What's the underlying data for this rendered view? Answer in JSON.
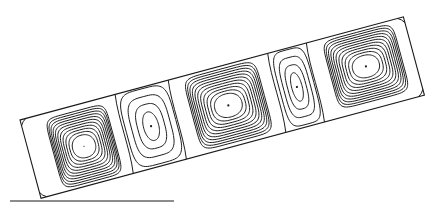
{
  "figure": {
    "stroke_color": "#1a1a1a",
    "background": "#ffffff",
    "enclosure": {
      "origin": [
        20,
        120
      ],
      "length": 397,
      "height": 81,
      "tilt_deg": -15.05
    },
    "baseline": {
      "x1": 10,
      "y1": 201,
      "x2": 174,
      "y2": 201
    },
    "cells": [
      {
        "name": "cell-1",
        "start": 0,
        "width": 97,
        "center": [
          55,
          42
        ],
        "contours": 11,
        "size": "large"
      },
      {
        "name": "cell-2",
        "start": 97,
        "width": 55,
        "center": [
          125,
          40
        ],
        "contours": 4,
        "size": "small"
      },
      {
        "name": "cell-3",
        "start": 152,
        "width": 103,
        "center": [
          205,
          40
        ],
        "contours": 11,
        "size": "large"
      },
      {
        "name": "cell-4",
        "start": 255,
        "width": 40,
        "center": [
          276,
          40
        ],
        "contours": 4,
        "size": "small"
      },
      {
        "name": "cell-5",
        "start": 295,
        "width": 102,
        "center": [
          348,
          38
        ],
        "contours": 11,
        "size": "large"
      }
    ]
  }
}
